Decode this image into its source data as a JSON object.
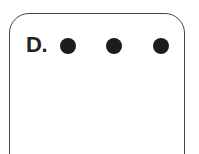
{
  "panel": {
    "label": "D.",
    "dots": [
      {
        "name": "dot-1",
        "color": "#1c1c1c"
      },
      {
        "name": "dot-2",
        "color": "#1c1c1c"
      },
      {
        "name": "dot-3",
        "color": "#1c1c1c"
      }
    ]
  }
}
